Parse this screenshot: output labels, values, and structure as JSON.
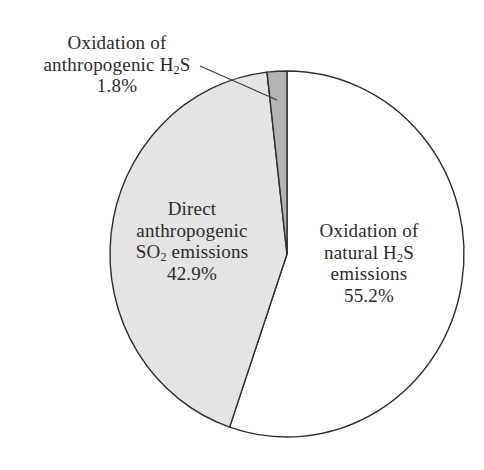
{
  "chart_data": {
    "type": "pie",
    "title": "",
    "start_angle_deg": 0,
    "direction": "clockwise",
    "grid": false,
    "legend": "none (direct labels)",
    "slices": [
      {
        "label": "Oxidation of natural H2S emissions",
        "value": 55.2,
        "color": "#ffffff"
      },
      {
        "label": "Direct anthropogenic SO2 emissions",
        "value": 42.9,
        "color": "#e4e4e4"
      },
      {
        "label": "Oxidation of anthropogenic H2S",
        "value": 1.8,
        "color": "#b4b4b4"
      }
    ],
    "annotations": [
      {
        "text": "Oxidation of anthropogenic H2S 1.8%",
        "leader_line": true
      }
    ]
  },
  "labels": {
    "natural": {
      "line1": "Oxidation of",
      "line2a": "natural H",
      "line2sub": "2",
      "line2b": "S",
      "line3": "emissions",
      "pct": "55.2%"
    },
    "so2": {
      "line1": "Direct",
      "line2": "anthropogenic",
      "line3a": "SO",
      "line3sub": "2",
      "line3b": " emissions",
      "pct": "42.9%"
    },
    "anthro_h2s": {
      "line1": "Oxidation of",
      "line2a": "anthropogenic H",
      "line2sub": "2",
      "line2b": "S",
      "pct": "1.8%"
    }
  },
  "colors": {
    "outline": "#2e2e2e",
    "natural": "#ffffff",
    "so2": "#e4e4e4",
    "anthro_h2s": "#b4b4b4"
  }
}
